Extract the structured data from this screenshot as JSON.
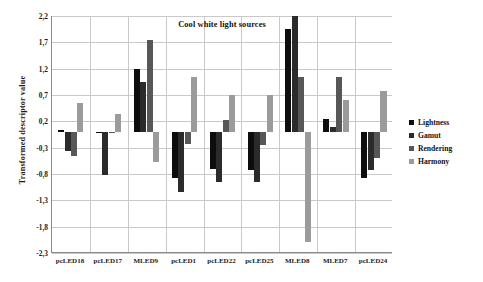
{
  "chart_data": {
    "type": "bar",
    "title": "Cool white light sources",
    "xlabel": "",
    "ylabel": "Transformed descriptor value",
    "ylim": [
      -2.3,
      2.2
    ],
    "ytick_step": 0.5,
    "ytick_labels": [
      "2,2",
      "1,7",
      "1,2",
      "0,7",
      "0,2",
      "-0,3",
      "-0,8",
      "-1,3",
      "-1,8",
      "-2,3"
    ],
    "ytick_values": [
      2.2,
      1.7,
      1.2,
      0.7,
      0.2,
      -0.3,
      -0.8,
      -1.3,
      -1.8,
      -2.3
    ],
    "grid": true,
    "legend_position": "right",
    "categories": [
      "pcLED18",
      "pcLED17",
      "MLED9",
      "pcLED1",
      "pcLED22",
      "pcLED25",
      "MLED8",
      "MLED7",
      "pcLED24"
    ],
    "series": [
      {
        "name": "Lightness",
        "color": "#0d0d0d",
        "values": [
          0.04,
          -0.02,
          1.2,
          -0.87,
          -0.7,
          -0.73,
          1.95,
          0.25,
          -0.88
        ]
      },
      {
        "name": "Gamut",
        "color": "#2b2b2b",
        "values": [
          -0.36,
          -0.81,
          0.95,
          -1.14,
          -0.95,
          -0.95,
          2.2,
          0.1,
          -0.72
        ]
      },
      {
        "name": "Rendering",
        "color": "#575757",
        "values": [
          -0.46,
          -0.02,
          1.75,
          -0.24,
          0.22,
          -0.25,
          1.05,
          1.05,
          -0.5
        ]
      },
      {
        "name": "Harmony",
        "color": "#9b9b9b",
        "values": [
          0.54,
          0.34,
          -0.57,
          1.05,
          0.7,
          0.7,
          -2.1,
          0.6,
          0.78
        ]
      }
    ]
  }
}
